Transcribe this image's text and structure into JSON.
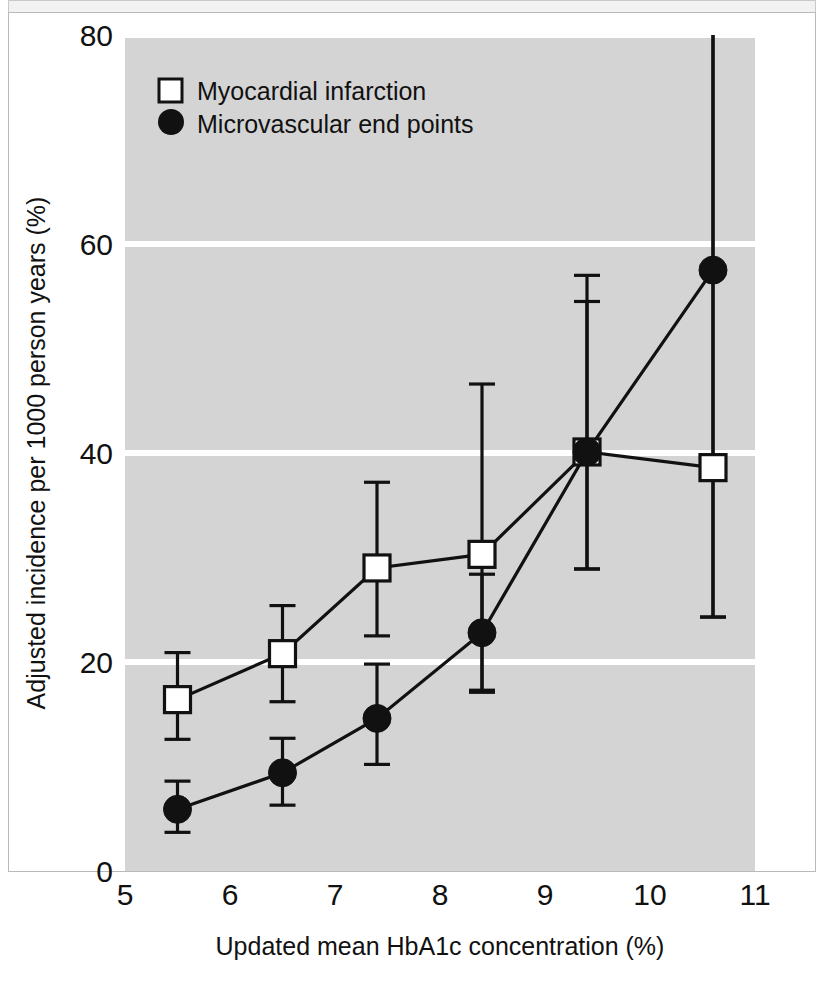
{
  "chart_data": {
    "type": "line",
    "title": "",
    "subtitle": "",
    "xlabel": "Updated mean HbA1c concentration (%)",
    "ylabel": "Adjusted incidence per 1000 person years (%)",
    "xlim": [
      5,
      11
    ],
    "ylim": [
      0,
      80
    ],
    "xticks": [
      "5",
      "6",
      "7",
      "8",
      "9",
      "10",
      "11"
    ],
    "yticks": [
      "0",
      "20",
      "40",
      "60",
      "80"
    ],
    "grid": "horizontal-white-gridlines",
    "plot_background": "#d4d4d4",
    "legend_position": "top-left",
    "x": [
      5.5,
      6.5,
      7.4,
      8.4,
      9.4,
      10.6
    ],
    "series": [
      {
        "name": "Myocardial infarction",
        "marker": "open-square",
        "marker_fill": "#ffffff",
        "marker_stroke": "#111111",
        "values": [
          16.4,
          20.8,
          29.0,
          30.3,
          40.1,
          38.6
        ],
        "error_low": [
          12.6,
          16.2,
          22.5,
          17.1,
          28.9,
          24.3
        ],
        "error_high": [
          20.9,
          25.4,
          37.2,
          46.6,
          57.0,
          80.0
        ]
      },
      {
        "name": "Microvascular end points",
        "marker": "filled-circle",
        "marker_fill": "#111111",
        "marker_stroke": "#111111",
        "values": [
          5.9,
          9.4,
          14.6,
          22.8,
          40.1,
          57.5
        ],
        "error_low": [
          3.7,
          6.3,
          10.2,
          17.3,
          28.9,
          24.3
        ],
        "error_high": [
          8.6,
          12.7,
          19.8,
          28.4,
          54.5,
          80.0
        ]
      }
    ]
  },
  "legend": {
    "items": [
      {
        "label": "Myocardial infarction",
        "marker": "open-square"
      },
      {
        "label": "Microvascular end points",
        "marker": "filled-circle"
      }
    ]
  },
  "axes": {
    "x_title": "Updated mean HbA1c concentration (%)",
    "y_title": "Adjusted incidence per 1000 person years (%)",
    "x_tick_labels": [
      "5",
      "6",
      "7",
      "8",
      "9",
      "10",
      "11"
    ],
    "y_tick_labels": [
      "0",
      "20",
      "40",
      "60",
      "80"
    ]
  },
  "colors": {
    "plot_background": "#d4d4d4",
    "gridline": "#ffffff",
    "ink": "#111111",
    "page_background": "#ffffff",
    "frame": "#b9b9b9"
  }
}
